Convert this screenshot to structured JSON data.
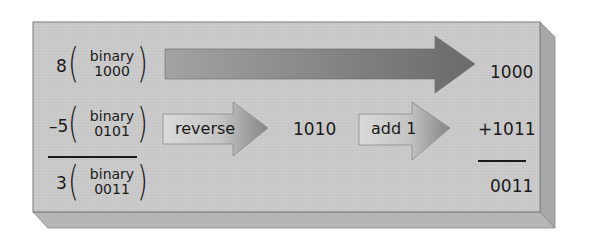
{
  "diagram": {
    "rows": [
      {
        "id": "row-8",
        "decimal": "8",
        "label_top": "binary",
        "label_bottom": "1000",
        "result": "1000"
      },
      {
        "id": "row-minus5",
        "decimal": "–5",
        "label_top": "binary",
        "label_bottom": "0101",
        "step1_label": "reverse",
        "step1_value": "1010",
        "step2_label": "add 1",
        "result": "+1011"
      },
      {
        "id": "row-3",
        "decimal": "3",
        "label_top": "binary",
        "label_bottom": "0011",
        "result": "0011"
      }
    ],
    "colors": {
      "face": "#c8c8c8",
      "bevel_right": "#a9a9a9",
      "bevel_bottom": "#b5b5b5",
      "big_arrow_start": "#9a9a9a",
      "big_arrow_end": "#6e6e6e",
      "small_arrow_body": "#d4d4d4",
      "small_arrow_head": "#8c8c8c"
    }
  }
}
